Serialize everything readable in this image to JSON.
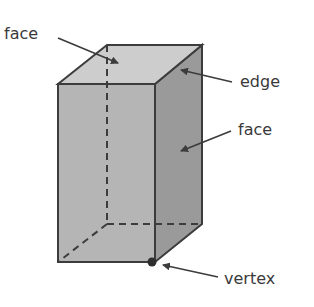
{
  "diagram": {
    "labels": {
      "face_top": "face",
      "edge": "edge",
      "face_side": "face",
      "vertex": "vertex"
    },
    "colors": {
      "front_face": "#b5b5b5",
      "side_face": "#9a9a9a",
      "top_face": "#cdcdcd",
      "stroke": "#3c3c3c",
      "text": "#3a3a3a"
    }
  }
}
